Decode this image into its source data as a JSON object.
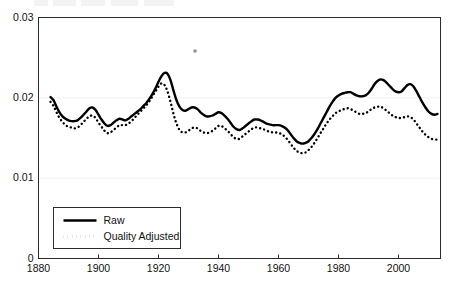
{
  "chart_data": {
    "type": "line",
    "title": "",
    "xlabel": "",
    "ylabel": "",
    "xlim": [
      1880,
      2014
    ],
    "ylim": [
      0,
      0.03
    ],
    "grid": false,
    "legend_position": "bottom-left",
    "x_ticks": [
      "1880",
      "1900",
      "1920",
      "1940",
      "1960",
      "1980",
      "2000"
    ],
    "x_tick_values": [
      1880,
      1900,
      1920,
      1940,
      1960,
      1980,
      2000
    ],
    "y_ticks": [
      "0",
      "0.01",
      "0.02",
      "0.03"
    ],
    "y_tick_values": [
      0,
      0.01,
      0.02,
      0.03
    ],
    "x": [
      1884,
      1885,
      1886,
      1887,
      1888,
      1889,
      1890,
      1891,
      1892,
      1893,
      1894,
      1895,
      1896,
      1897,
      1898,
      1899,
      1900,
      1901,
      1902,
      1903,
      1904,
      1905,
      1906,
      1907,
      1908,
      1909,
      1910,
      1911,
      1912,
      1913,
      1914,
      1915,
      1916,
      1917,
      1918,
      1919,
      1920,
      1921,
      1922,
      1923,
      1924,
      1925,
      1926,
      1927,
      1928,
      1929,
      1930,
      1931,
      1932,
      1933,
      1934,
      1935,
      1936,
      1937,
      1938,
      1939,
      1940,
      1941,
      1942,
      1943,
      1944,
      1945,
      1946,
      1947,
      1948,
      1949,
      1950,
      1951,
      1952,
      1953,
      1954,
      1955,
      1956,
      1957,
      1958,
      1959,
      1960,
      1961,
      1962,
      1963,
      1964,
      1965,
      1966,
      1967,
      1968,
      1969,
      1970,
      1971,
      1972,
      1973,
      1974,
      1975,
      1976,
      1977,
      1978,
      1979,
      1980,
      1981,
      1982,
      1983,
      1984,
      1985,
      1986,
      1987,
      1988,
      1989,
      1990,
      1991,
      1992,
      1993,
      1994,
      1995,
      1996,
      1997,
      1998,
      1999,
      2000,
      2001,
      2002,
      2003,
      2004,
      2005,
      2006,
      2007,
      2008,
      2009,
      2010,
      2011,
      2012,
      2013
    ],
    "series": [
      {
        "name": "Raw",
        "style": "solid",
        "color": "#000000",
        "values": [
          0.0201,
          0.0197,
          0.0189,
          0.0182,
          0.0177,
          0.0174,
          0.0172,
          0.0171,
          0.0171,
          0.0172,
          0.0175,
          0.0179,
          0.0183,
          0.0187,
          0.0188,
          0.0185,
          0.0179,
          0.0173,
          0.0168,
          0.0165,
          0.0166,
          0.0169,
          0.0172,
          0.0174,
          0.0173,
          0.0172,
          0.0174,
          0.0177,
          0.018,
          0.0183,
          0.0186,
          0.019,
          0.0194,
          0.0199,
          0.0205,
          0.0212,
          0.022,
          0.0227,
          0.0231,
          0.023,
          0.0222,
          0.0209,
          0.0197,
          0.0189,
          0.0185,
          0.0184,
          0.0186,
          0.0188,
          0.0188,
          0.0186,
          0.0182,
          0.0179,
          0.0177,
          0.0177,
          0.0178,
          0.018,
          0.0182,
          0.0181,
          0.0178,
          0.0174,
          0.0169,
          0.0164,
          0.0161,
          0.016,
          0.0162,
          0.0165,
          0.0168,
          0.0171,
          0.0173,
          0.0173,
          0.0172,
          0.017,
          0.0168,
          0.0167,
          0.0166,
          0.0166,
          0.0166,
          0.0165,
          0.0163,
          0.016,
          0.0155,
          0.015,
          0.0146,
          0.0144,
          0.0143,
          0.0144,
          0.0146,
          0.015,
          0.0155,
          0.0161,
          0.0168,
          0.0175,
          0.0182,
          0.0189,
          0.0195,
          0.02,
          0.0203,
          0.0205,
          0.0206,
          0.0207,
          0.0207,
          0.0205,
          0.0203,
          0.0202,
          0.0202,
          0.0203,
          0.0206,
          0.0211,
          0.0217,
          0.0221,
          0.0223,
          0.0222,
          0.0219,
          0.0215,
          0.0211,
          0.0208,
          0.0207,
          0.0208,
          0.0212,
          0.0216,
          0.0217,
          0.0214,
          0.0208,
          0.0201,
          0.0194,
          0.0188,
          0.0183,
          0.018,
          0.0179,
          0.018
        ]
      },
      {
        "name": "Quality Adjusted",
        "style": "dotted",
        "color": "#000000",
        "values": [
          0.0195,
          0.019,
          0.0182,
          0.0175,
          0.017,
          0.0166,
          0.0164,
          0.0163,
          0.0162,
          0.0163,
          0.0166,
          0.017,
          0.0174,
          0.0177,
          0.0178,
          0.0175,
          0.0169,
          0.0164,
          0.0159,
          0.0156,
          0.0157,
          0.016,
          0.0163,
          0.0166,
          0.0166,
          0.0166,
          0.0168,
          0.0171,
          0.0175,
          0.0179,
          0.0183,
          0.0187,
          0.0191,
          0.0196,
          0.0202,
          0.0208,
          0.0214,
          0.0218,
          0.0216,
          0.0208,
          0.0195,
          0.018,
          0.0168,
          0.016,
          0.0157,
          0.0157,
          0.0159,
          0.0162,
          0.0163,
          0.0162,
          0.0159,
          0.0157,
          0.0156,
          0.0157,
          0.0159,
          0.0162,
          0.0165,
          0.0165,
          0.0162,
          0.0159,
          0.0155,
          0.0151,
          0.0149,
          0.0149,
          0.0152,
          0.0155,
          0.0158,
          0.0161,
          0.0163,
          0.0163,
          0.0162,
          0.0161,
          0.0159,
          0.0158,
          0.0157,
          0.0157,
          0.0156,
          0.0155,
          0.0152,
          0.0148,
          0.0143,
          0.0138,
          0.0134,
          0.0132,
          0.0131,
          0.0132,
          0.0135,
          0.0139,
          0.0144,
          0.015,
          0.0156,
          0.0162,
          0.0168,
          0.0173,
          0.0177,
          0.0181,
          0.0183,
          0.0185,
          0.0186,
          0.0187,
          0.0186,
          0.0184,
          0.0182,
          0.018,
          0.018,
          0.0181,
          0.0183,
          0.0186,
          0.0188,
          0.0189,
          0.0189,
          0.0187,
          0.0184,
          0.0181,
          0.0178,
          0.0176,
          0.0175,
          0.0175,
          0.0176,
          0.0177,
          0.0176,
          0.0173,
          0.0168,
          0.0163,
          0.0158,
          0.0154,
          0.0151,
          0.0149,
          0.0148,
          0.0148
        ]
      }
    ],
    "annotations": [
      {
        "name": "speck",
        "x_px": 195,
        "y_px": 51
      }
    ]
  },
  "legend": {
    "items": [
      {
        "label": "Raw"
      },
      {
        "label": "Quality Adjusted"
      }
    ]
  }
}
